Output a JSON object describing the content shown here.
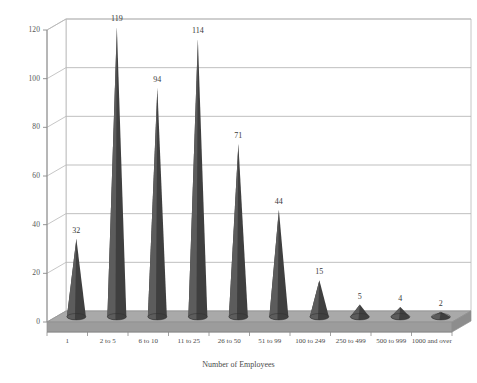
{
  "chart_data": {
    "type": "bar",
    "style": "3d-cone",
    "title": "",
    "xlabel": "Number of Employees",
    "ylabel": "",
    "categories": [
      "1",
      "2 to 5",
      "6 to 10",
      "11 to 25",
      "26 to 50",
      "51 to 99",
      "100 to 249",
      "250 to 499",
      "500 to 999",
      "1000 and over"
    ],
    "values": [
      32,
      119,
      94,
      114,
      71,
      44,
      15,
      5,
      4,
      2
    ],
    "data_labels": [
      "32",
      "119",
      "94",
      "114",
      "71",
      "44",
      "15",
      "5",
      "4",
      "2"
    ],
    "ylim": [
      0,
      120
    ],
    "yticks": [
      0,
      20,
      40,
      60,
      80,
      100,
      120
    ],
    "ytick_labels": [
      "0",
      "20",
      "40",
      "60",
      "80",
      "100",
      "120"
    ],
    "grid": true,
    "legend": false,
    "colors": {
      "cone_dark": "#3f3f3f",
      "cone_light": "#5c5c5c",
      "floor": "#a9a9a9",
      "floor_edge": "#8f8f8f",
      "gridline": "#b8b8b8",
      "axis": "#8a8a8a",
      "background": "#ffffff",
      "text": "#4a4a4a"
    }
  }
}
